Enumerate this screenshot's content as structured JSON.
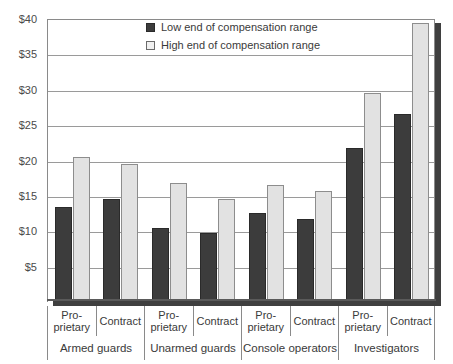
{
  "chart_data": {
    "type": "bar",
    "title": "",
    "xlabel": "",
    "ylabel": "",
    "ylim": [
      0,
      40
    ],
    "ytick_values": [
      40,
      35,
      30,
      25,
      20,
      15,
      10,
      5
    ],
    "ytick_labels": [
      "$40",
      "$35",
      "$30",
      "$25",
      "$20",
      "$15",
      "$10",
      "$5"
    ],
    "grid": true,
    "legend_position": "top-center",
    "categories": [
      "Pro-prietary",
      "Contract",
      "Pro-prietary",
      "Contract",
      "Pro-prietary",
      "Contract",
      "Pro-prietary",
      "Contract"
    ],
    "category_lines": [
      [
        "Pro-",
        "prietary"
      ],
      [
        "Contract"
      ],
      [
        "Pro-",
        "prietary"
      ],
      [
        "Contract"
      ],
      [
        "Pro-",
        "prietary"
      ],
      [
        "Contract"
      ],
      [
        "Pro-",
        "prietary"
      ],
      [
        "Contract"
      ]
    ],
    "groups": [
      {
        "label": "Armed guards",
        "span": 2
      },
      {
        "label": "Unarmed guards",
        "span": 2
      },
      {
        "label": "Console operators",
        "span": 2
      },
      {
        "label": "Investigators",
        "span": 2
      }
    ],
    "series": [
      {
        "name": "Low end of compensation range",
        "color": "#3c3c3c",
        "values": [
          13.5,
          14.5,
          10.5,
          9.8,
          12.6,
          11.7,
          21.7,
          26.6
        ]
      },
      {
        "name": "High end of compensation range",
        "color": "#e2e2e2",
        "values": [
          20.5,
          19.5,
          16.8,
          14.5,
          16.5,
          15.7,
          29.6,
          39.5
        ]
      }
    ]
  },
  "legend": {
    "items": [
      {
        "label": "Low end of compensation range",
        "swatch": "low"
      },
      {
        "label": "High end of compensation range",
        "swatch": "high"
      }
    ]
  }
}
